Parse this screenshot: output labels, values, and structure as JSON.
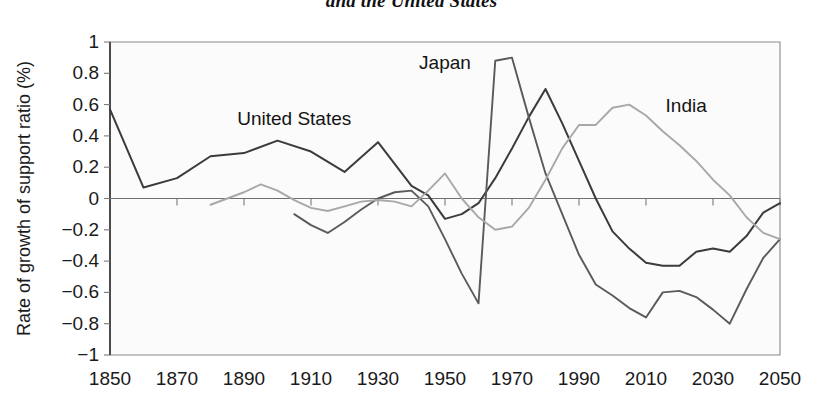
{
  "title": "and the United States",
  "axes": {
    "ylabel": "Rate of growth of support ratio (%)",
    "xlabel": "",
    "y_ticks": [
      "1",
      "0.8",
      "0.6",
      "0.4",
      "0.2",
      "0",
      "−0.2",
      "−0.4",
      "−0.6",
      "−0.8",
      "−1"
    ],
    "x_ticks": [
      "1850",
      "1870",
      "1890",
      "1910",
      "1930",
      "1950",
      "1970",
      "1990",
      "2010",
      "2030",
      "2050"
    ]
  },
  "series_labels": {
    "united_states": "United States",
    "japan": "Japan",
    "india": "India"
  },
  "colors": {
    "united_states": "#3b3b3b",
    "japan": "#5a5a5a",
    "india": "#a8a8a8",
    "axis": "#8a8a8a",
    "text": "#1a1a1a",
    "background": "#fbfbfb"
  },
  "chart_data": {
    "type": "line",
    "title": "and the United States",
    "xlabel": "",
    "ylabel": "Rate of growth of support ratio (%)",
    "xlim": [
      1850,
      2050
    ],
    "ylim": [
      -1,
      1
    ],
    "y_tick_values": [
      1,
      0.8,
      0.6,
      0.4,
      0.2,
      0,
      -0.2,
      -0.4,
      -0.6,
      -0.8,
      -1
    ],
    "x_tick_values": [
      1850,
      1870,
      1890,
      1910,
      1930,
      1950,
      1970,
      1990,
      2010,
      2030,
      2050
    ],
    "grid": false,
    "legend": "inline-annotations",
    "series": [
      {
        "name": "United States",
        "color": "#3b3b3b",
        "x": [
          1850,
          1860,
          1870,
          1880,
          1890,
          1900,
          1910,
          1920,
          1930,
          1940,
          1945,
          1950,
          1955,
          1960,
          1965,
          1970,
          1975,
          1980,
          1985,
          1990,
          1995,
          2000,
          2005,
          2010,
          2015,
          2020,
          2025,
          2030,
          2035,
          2040,
          2045,
          2050
        ],
        "y": [
          0.57,
          0.07,
          0.13,
          0.27,
          0.29,
          0.37,
          0.3,
          0.17,
          0.36,
          0.08,
          0.02,
          -0.13,
          -0.1,
          -0.03,
          0.13,
          0.32,
          0.52,
          0.7,
          0.48,
          0.24,
          0.0,
          -0.21,
          -0.32,
          -0.41,
          -0.43,
          -0.43,
          -0.34,
          -0.32,
          -0.34,
          -0.24,
          -0.09,
          -0.03
        ]
      },
      {
        "name": "Japan",
        "color": "#5a5a5a",
        "x": [
          1905,
          1910,
          1915,
          1920,
          1925,
          1930,
          1935,
          1940,
          1945,
          1950,
          1955,
          1960,
          1965,
          1970,
          1975,
          1980,
          1985,
          1990,
          1995,
          2000,
          2005,
          2010,
          2015,
          2020,
          2025,
          2030,
          2035,
          2040,
          2045,
          2050
        ],
        "y": [
          -0.1,
          -0.17,
          -0.22,
          -0.15,
          -0.07,
          0.0,
          0.04,
          0.05,
          -0.05,
          -0.26,
          -0.48,
          -0.67,
          0.88,
          0.9,
          0.52,
          0.16,
          -0.1,
          -0.36,
          -0.55,
          -0.62,
          -0.7,
          -0.76,
          -0.6,
          -0.59,
          -0.63,
          -0.71,
          -0.8,
          -0.58,
          -0.38,
          -0.26
        ]
      },
      {
        "name": "India",
        "color": "#a8a8a8",
        "x": [
          1880,
          1885,
          1890,
          1895,
          1900,
          1905,
          1910,
          1915,
          1920,
          1925,
          1930,
          1935,
          1940,
          1945,
          1950,
          1955,
          1960,
          1965,
          1970,
          1975,
          1980,
          1985,
          1990,
          1995,
          2000,
          2005,
          2010,
          2015,
          2020,
          2025,
          2030,
          2035,
          2040,
          2045,
          2050
        ],
        "y": [
          -0.04,
          0.0,
          0.04,
          0.09,
          0.05,
          -0.01,
          -0.06,
          -0.08,
          -0.05,
          -0.02,
          -0.01,
          -0.02,
          -0.05,
          0.05,
          0.16,
          0.0,
          -0.12,
          -0.2,
          -0.18,
          -0.06,
          0.12,
          0.32,
          0.47,
          0.47,
          0.58,
          0.6,
          0.53,
          0.43,
          0.34,
          0.24,
          0.12,
          0.02,
          -0.12,
          -0.22,
          -0.26
        ]
      }
    ],
    "annotations": [
      {
        "text": "United States",
        "x": 1905,
        "y": 0.47
      },
      {
        "text": "Japan",
        "x": 1950,
        "y": 0.83
      },
      {
        "text": "India",
        "x": 2022,
        "y": 0.55
      }
    ]
  }
}
